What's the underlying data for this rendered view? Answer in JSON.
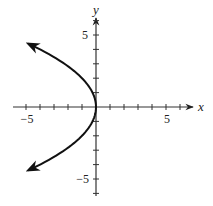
{
  "chart_data": {
    "type": "line",
    "title": "",
    "xlabel": "x",
    "ylabel": "y",
    "xlim": [
      -5.5,
      7
    ],
    "ylim": [
      -6.5,
      6.5
    ],
    "x_ticks": [
      -5,
      -4,
      -3,
      -2,
      -1,
      1,
      2,
      3,
      4,
      5,
      6
    ],
    "y_ticks": [
      -6,
      -5,
      -4,
      -3,
      -2,
      -1,
      1,
      2,
      3,
      4,
      5,
      6
    ],
    "x_tick_labels": [
      {
        "value": -5,
        "label": "−5"
      },
      {
        "value": 5,
        "label": "5"
      }
    ],
    "y_tick_labels": [
      {
        "value": 5,
        "label": "5"
      },
      {
        "value": -5,
        "label": "−5"
      }
    ],
    "grid": false,
    "legend": null,
    "series": [
      {
        "name": "x = -y^2/4",
        "description": "Left-opening parabola, vertex at origin, arrows at both ends",
        "points": [
          {
            "x": -4.8,
            "y": 4.4
          },
          {
            "x": -3.06,
            "y": 3.5
          },
          {
            "x": -2.25,
            "y": 3
          },
          {
            "x": -1,
            "y": 2
          },
          {
            "x": -0.25,
            "y": 1
          },
          {
            "x": 0,
            "y": 0
          },
          {
            "x": -0.25,
            "y": -1
          },
          {
            "x": -1,
            "y": -2
          },
          {
            "x": -2.25,
            "y": -3
          },
          {
            "x": -3.06,
            "y": -3.5
          },
          {
            "x": -4.8,
            "y": -4.4
          }
        ],
        "color": "#111111",
        "arrows": "both-ends"
      }
    ]
  },
  "axes": {
    "x_name": "x",
    "y_name": "y",
    "x_label_neg5": "−5",
    "x_label_5": "5",
    "y_label_5": "5",
    "y_label_neg5": "−5"
  }
}
